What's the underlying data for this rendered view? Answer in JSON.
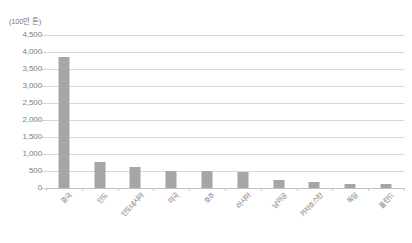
{
  "chart_data": {
    "type": "bar",
    "title": "",
    "subtitle": "",
    "unit_label": "(100만 톤)",
    "xlabel": "",
    "ylabel": "",
    "ylim": [
      0,
      4500
    ],
    "ytick_step": 500,
    "ytick_labels": [
      "4,500",
      "4,000",
      "3,500",
      "3,000",
      "2,500",
      "2,000",
      "1,500",
      "1,000",
      "500",
      "0"
    ],
    "ytick_values": [
      4500,
      4000,
      3500,
      3000,
      2500,
      2000,
      1500,
      1000,
      500,
      0
    ],
    "grid": true,
    "legend": false,
    "legend_position": "none",
    "bar_color": "#a6a6a6",
    "gridline_color": "#d9d9d9",
    "axis_color": "#bfbfbf",
    "text_color": "#7a7a7a",
    "categories": [
      "중국",
      "인도",
      "인도네시아",
      "미국",
      "호주",
      "러시아",
      "남아공",
      "카자흐스탄",
      "독일",
      "폴란드"
    ],
    "values": [
      3850,
      760,
      620,
      500,
      490,
      480,
      250,
      170,
      120,
      110
    ],
    "series": [
      {
        "name": "생산량",
        "values": [
          3850,
          760,
          620,
          500,
          490,
          480,
          250,
          170,
          120,
          110
        ]
      }
    ]
  }
}
